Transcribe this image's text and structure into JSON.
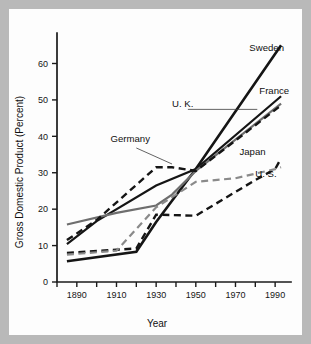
{
  "figure": {
    "background_color": "#b9b9b9",
    "card_color": "#fdfdfd",
    "axis_color": "#1b1b1b"
  },
  "chart_data": {
    "type": "line",
    "title": "",
    "xlabel": "Year",
    "ylabel": "Gross Domestic Product (Percent)",
    "xlim": [
      1880,
      1998
    ],
    "ylim": [
      0,
      67
    ],
    "grid": false,
    "legend_position": "inline-labels",
    "x_ticks_major": [
      1890,
      1910,
      1930,
      1950,
      1970,
      1990
    ],
    "x_ticks_minor": [
      1880,
      1890,
      1900,
      1910,
      1920,
      1930,
      1940,
      1950,
      1960,
      1970,
      1980,
      1990
    ],
    "x_ticklabels": [
      "1890",
      "1910",
      "1930",
      "1950",
      "1970",
      "1990"
    ],
    "y_ticks": [
      0,
      10,
      20,
      30,
      40,
      50,
      60
    ],
    "y_ticklabels": [
      "0",
      "10",
      "20",
      "30",
      "40",
      "50",
      "60"
    ],
    "series": [
      {
        "name": "Sweden",
        "label": "Sweden",
        "style": "solid",
        "color": "#151515",
        "width": 2.6,
        "x": [
          1885,
          1920,
          1930,
          1950,
          1993
        ],
        "values": [
          5.7,
          8.3,
          16.5,
          31.0,
          65.0
        ]
      },
      {
        "name": "France",
        "label": "France",
        "style": "solid",
        "color": "#151515",
        "width": 2.2,
        "x": [
          1885,
          1900,
          1930,
          1950,
          1993
        ],
        "values": [
          10.4,
          16.7,
          26.5,
          31.0,
          51.0
        ]
      },
      {
        "name": "U. K.",
        "label": "U. K.",
        "style": "solid",
        "color": "#6e6e6e",
        "width": 2.2,
        "x": [
          1885,
          1910,
          1930,
          1938,
          1950,
          1993
        ],
        "values": [
          15.8,
          19.0,
          21.0,
          24.0,
          30.5,
          49.0
        ]
      },
      {
        "name": "Germany",
        "label": "Germany",
        "style": "dashed",
        "color": "#151515",
        "width": 2.4,
        "x": [
          1885,
          1900,
          1930,
          1938,
          1950,
          1993
        ],
        "values": [
          11.5,
          17.0,
          31.5,
          31.5,
          30.5,
          48.5
        ]
      },
      {
        "name": "Japan",
        "label": "Japan",
        "style": "dashed",
        "color": "#151515",
        "width": 2.4,
        "x": [
          1885,
          1920,
          1930,
          1950,
          1980,
          1990,
          1993
        ],
        "values": [
          8.0,
          9.2,
          18.5,
          18.2,
          28.0,
          31.0,
          34.0
        ]
      },
      {
        "name": "U. S.",
        "label": "U. S.",
        "style": "dashed",
        "color": "#8a8a8a",
        "width": 2.2,
        "x": [
          1885,
          1910,
          1930,
          1950,
          1970,
          1990,
          1993
        ],
        "values": [
          7.5,
          8.6,
          20.5,
          27.5,
          28.5,
          31.0,
          31.5
        ]
      }
    ],
    "annotations": [
      {
        "text": "Sweden",
        "x": 1977,
        "y": 63.5
      },
      {
        "text": "France",
        "x": 1982,
        "y": 51.5
      },
      {
        "text": "U. K.",
        "x": 1938,
        "y": 48.0,
        "leader": true
      },
      {
        "text": "Germany",
        "x": 1907,
        "y": 38.5,
        "leader": true
      },
      {
        "text": "Japan",
        "x": 1972,
        "y": 35.0
      },
      {
        "text": "U. S.",
        "x": 1980,
        "y": 28.8
      }
    ]
  }
}
